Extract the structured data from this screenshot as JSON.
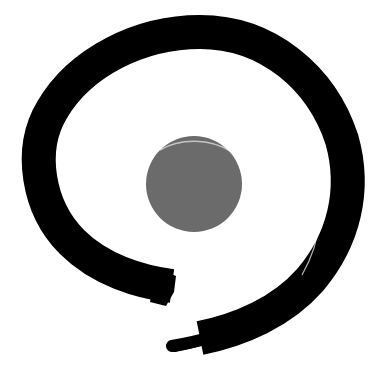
{
  "image": {
    "subject": "enso brush circle with gray center dot",
    "background_color": "#ffffff",
    "ring_color": "#000000",
    "dot_color": "#6b6b6b"
  }
}
